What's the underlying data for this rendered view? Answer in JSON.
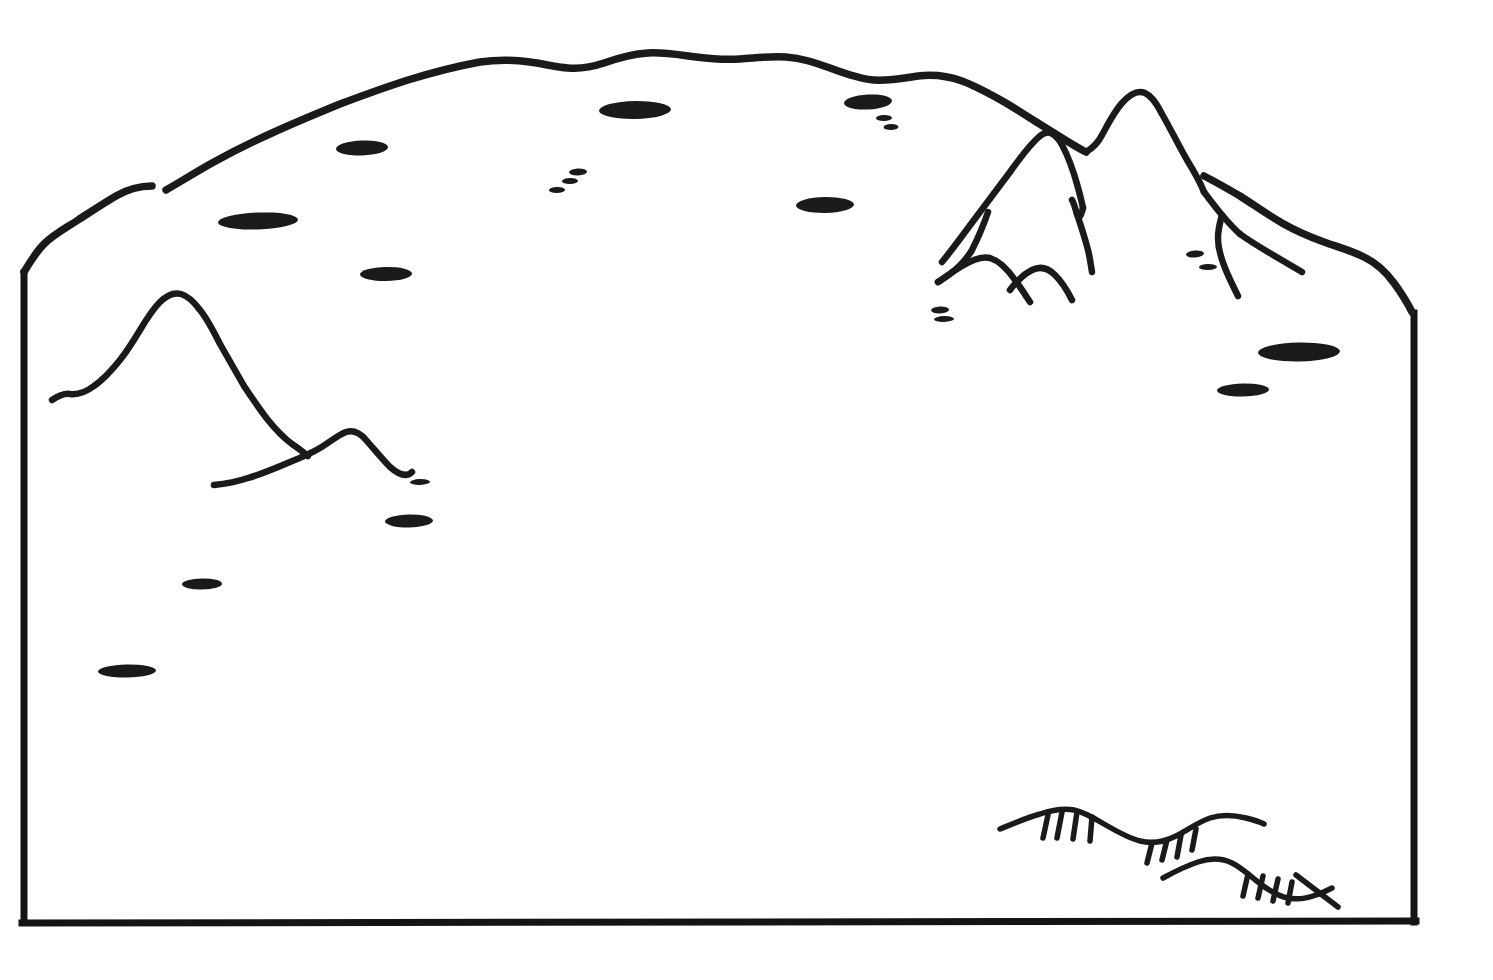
{
  "document": {
    "title": "Hand-drawn Terrain Sketch Map",
    "type": "line-drawing",
    "background_color": "#ffffff",
    "ink_color": "#1a1a1a",
    "width": 1493,
    "height": 980
  },
  "chart_data": {
    "type": "diagram",
    "subtitle": "",
    "xlabel": "",
    "ylabel": "",
    "grid": false,
    "legend": "none",
    "annotations": []
  },
  "frame": {
    "name": "map-frame",
    "left_x": 22,
    "right_x": 1415,
    "bottom_y": 925,
    "left_top_y": 273,
    "right_top_y": 312,
    "stroke_width": 7,
    "color": "#141414",
    "note": "Open at the top; the freehand boundary arc closes the shape."
  },
  "boundary": {
    "name": "upper-boundary-arc",
    "color": "#1a1a1a",
    "stroke_width": 7.5,
    "apex_y": 57,
    "apex_x_range": [
      650,
      780
    ],
    "has_gap": true,
    "gap_x_range": [
      150,
      168
    ],
    "gap_y": 190
  },
  "features": {
    "mountain_left": {
      "label": "left mountain ridge profile",
      "peak_x": 176,
      "peak_y": 295,
      "extent_x": [
        52,
        425
      ]
    },
    "mountain_right_group": {
      "label": "right mountain peak cluster",
      "peaks": [
        {
          "x": 1043,
          "y": 134
        },
        {
          "x": 1143,
          "y": 93
        }
      ],
      "foothills": [
        {
          "x": 985,
          "y": 255
        },
        {
          "x": 1043,
          "y": 268
        }
      ],
      "extent_x": [
        938,
        1302
      ]
    },
    "escarpment_upper": {
      "label": "upper escarpment hachure symbol",
      "extent_x": [
        1000,
        1262
      ],
      "extent_y": [
        808,
        858
      ],
      "tick_count": 8
    },
    "escarpment_lower": {
      "label": "lower escarpment hachure symbol",
      "extent_x": [
        1163,
        1340
      ],
      "extent_y": [
        858,
        908
      ],
      "tick_count": 5
    }
  },
  "blobs": [
    {
      "name": "blob-1",
      "cx": 258,
      "cy": 221,
      "rx": 40,
      "ry": 8.5,
      "rot": -2
    },
    {
      "name": "blob-2",
      "cx": 362,
      "cy": 148,
      "rx": 26,
      "ry": 7.5,
      "rot": -2
    },
    {
      "name": "blob-3",
      "cx": 386,
      "cy": 274,
      "rx": 26,
      "ry": 7,
      "rot": -1
    },
    {
      "name": "blob-4",
      "cx": 635,
      "cy": 110,
      "rx": 36,
      "ry": 9,
      "rot": -1
    },
    {
      "name": "blob-5",
      "cx": 825,
      "cy": 205,
      "rx": 29,
      "ry": 8,
      "rot": -1
    },
    {
      "name": "blob-6",
      "cx": 868,
      "cy": 102,
      "rx": 24,
      "ry": 7.5,
      "rot": -3
    },
    {
      "name": "blob-7",
      "cx": 1299,
      "cy": 352,
      "rx": 41,
      "ry": 9.5,
      "rot": -1
    },
    {
      "name": "blob-8",
      "cx": 1243,
      "cy": 390,
      "rx": 26,
      "ry": 6.5,
      "rot": -1
    },
    {
      "name": "blob-9",
      "cx": 409,
      "cy": 521,
      "rx": 24,
      "ry": 6.5,
      "rot": -1
    },
    {
      "name": "blob-10",
      "cx": 202,
      "cy": 584,
      "rx": 20,
      "ry": 5.5,
      "rot": -1
    },
    {
      "name": "blob-11",
      "cx": 127,
      "cy": 671,
      "rx": 29,
      "ry": 6.5,
      "rot": -1
    }
  ],
  "dashes": [
    {
      "name": "dash-1",
      "cx": 578,
      "cy": 172,
      "rx": 9,
      "ry": 3.5,
      "rot": -2
    },
    {
      "name": "dash-2",
      "cx": 570,
      "cy": 181,
      "rx": 8,
      "ry": 3,
      "rot": -2
    },
    {
      "name": "dash-3",
      "cx": 557,
      "cy": 190,
      "rx": 8,
      "ry": 3,
      "rot": -2
    },
    {
      "name": "dash-4",
      "cx": 884,
      "cy": 118,
      "rx": 8,
      "ry": 3,
      "rot": -2
    },
    {
      "name": "dash-5",
      "cx": 891,
      "cy": 127,
      "rx": 7.5,
      "ry": 3,
      "rot": -2
    },
    {
      "name": "dash-6",
      "cx": 940,
      "cy": 310,
      "rx": 9,
      "ry": 3.5,
      "rot": -2
    },
    {
      "name": "dash-7",
      "cx": 944,
      "cy": 319,
      "rx": 10,
      "ry": 3,
      "rot": -2
    },
    {
      "name": "dash-8",
      "cx": 1195,
      "cy": 254,
      "rx": 9,
      "ry": 3.5,
      "rot": -4
    },
    {
      "name": "dash-9",
      "cx": 1208,
      "cy": 267,
      "rx": 9,
      "ry": 3,
      "rot": -2
    },
    {
      "name": "dash-10",
      "cx": 420,
      "cy": 482,
      "rx": 10,
      "ry": 3,
      "rot": -2
    }
  ]
}
